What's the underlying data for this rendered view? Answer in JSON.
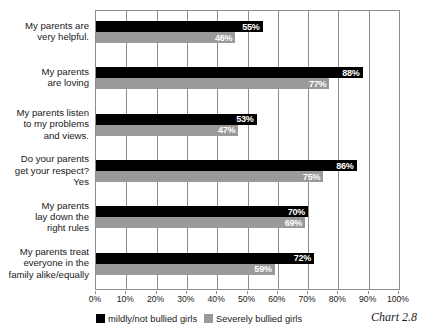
{
  "chart_data": {
    "type": "bar",
    "orientation": "horizontal",
    "title": "",
    "subtitle": "",
    "xlabel": "",
    "ylabel": "",
    "xlim": [
      0,
      100
    ],
    "xticks": [
      "0%",
      "10%",
      "20%",
      "30%",
      "40%",
      "50%",
      "60%",
      "70%",
      "80%",
      "90%",
      "100%"
    ],
    "grid": true,
    "legend_position": "bottom-left",
    "categories": [
      "My parents are\nvery helpful.",
      "My parents\nare loving",
      "My parents listen\nto my problems\nand views.",
      "Do your parents\nget your respect?\nYes",
      "My parents\nlay down the\nright rules",
      "My parents treat\neveryone in the\nfamily alike/equally"
    ],
    "series": [
      {
        "name": "mildly/not bullied girls",
        "color": "#000000",
        "values": [
          55,
          88,
          53,
          86,
          70,
          72
        ],
        "labels": [
          "55%",
          "88%",
          "53%",
          "86%",
          "70%",
          "72%"
        ]
      },
      {
        "name": "Severely bullied girls",
        "color": "#9a9a9a",
        "values": [
          46,
          77,
          47,
          75,
          69,
          59
        ],
        "labels": [
          "46%",
          "77%",
          "47%",
          "75%",
          "69%",
          "59%"
        ]
      }
    ],
    "caption": "Chart 2.8"
  },
  "legend": {
    "items": [
      {
        "label": "mildly/not bullied girls",
        "color": "#000000"
      },
      {
        "label": "Severely bullied girls",
        "color": "#9a9a9a"
      }
    ]
  },
  "caption": "Chart 2.8",
  "colors": {
    "series_black": "#000000",
    "series_gray": "#9a9a9a",
    "gridline": "#8d8d8d",
    "text": "#1a1a1a",
    "background": "#ffffff"
  }
}
